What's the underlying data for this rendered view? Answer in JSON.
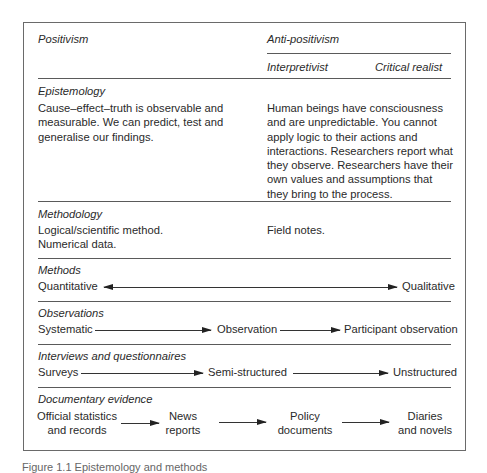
{
  "header": {
    "positivism": "Positivism",
    "anti_positivism": "Anti-positivism",
    "interpretivist": "Interpretivist",
    "critical_realist": "Critical realist"
  },
  "rows": {
    "epistemology": {
      "label": "Epistemology",
      "positivism": "Cause–effect–truth is observable and measurable. We can predict, test and generalise our findings.",
      "anti_positivism": "Human beings have consciousness and are unpredictable. You cannot apply logic to their actions and interactions. Researchers report what they observe. Researchers have their own values and assumptions that they bring to the process."
    },
    "methodology": {
      "label": "Methodology",
      "positivism_line1": "Logical/scientific method.",
      "positivism_line2": "Numerical data.",
      "anti_positivism": "Field notes."
    },
    "methods": {
      "label": "Methods",
      "left": "Quantitative",
      "right": "Qualitative"
    },
    "observations": {
      "label": "Observations",
      "steps": [
        "Systematic",
        "Observation",
        "Participant observation"
      ]
    },
    "interviews": {
      "label": "Interviews and questionnaires",
      "steps": [
        "Surveys",
        "Semi-structured",
        "Unstructured"
      ]
    },
    "documentary": {
      "label": "Documentary evidence",
      "steps": [
        {
          "line1": "Official statistics",
          "line2": "and records"
        },
        {
          "line1": "News",
          "line2": "reports"
        },
        {
          "line1": "Policy",
          "line2": "documents"
        },
        {
          "line1": "Diaries",
          "line2": "and novels"
        }
      ]
    }
  },
  "caption": "Figure 1.1 Epistemology and methods"
}
